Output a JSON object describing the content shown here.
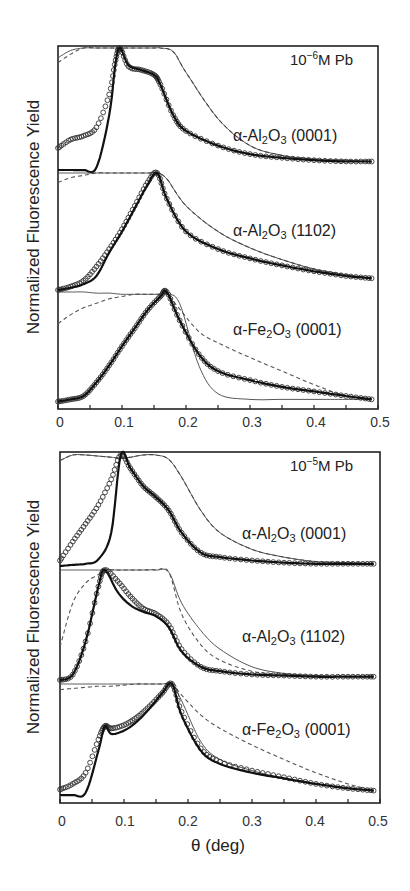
{
  "figure": {
    "ylabel": "Normalized Fluorescence Yield",
    "xlabel": "θ (deg)",
    "xticks": [
      "0",
      "0.1",
      "0.2",
      "0.3",
      "0.4",
      "0.5"
    ]
  },
  "panels": [
    {
      "title_base": "10",
      "title_exp": "−6",
      "title_rest": "M Pb",
      "curves": [
        {
          "label_pre": "α-Al",
          "sub1": "2",
          "mid": "O",
          "sub2": "3",
          "label_post": " (0001)"
        },
        {
          "label_pre": "α-Al",
          "sub1": "2",
          "mid": "O",
          "sub2": "3",
          "label_post": " (1102)"
        },
        {
          "label_pre": "α-Fe",
          "sub1": "2",
          "mid": "O",
          "sub2": "3",
          "label_post": " (0001)"
        }
      ]
    },
    {
      "title_base": "10",
      "title_exp": "−5",
      "title_rest": "M Pb",
      "curves": [
        {
          "label_pre": "α-Al",
          "sub1": "2",
          "mid": "O",
          "sub2": "3",
          "label_post": " (0001)"
        },
        {
          "label_pre": "α-Al",
          "sub1": "2",
          "mid": "O",
          "sub2": "3",
          "label_post": " (1102)"
        },
        {
          "label_pre": "α-Fe",
          "sub1": "2",
          "mid": "O",
          "sub2": "3",
          "label_post": " (0001)"
        }
      ]
    }
  ],
  "chart_data": [
    {
      "type": "scatter",
      "title": "10^-6 M Pb",
      "xlabel": "θ (deg)",
      "ylabel": "Normalized Fluorescence Yield",
      "xlim": [
        0,
        0.5
      ],
      "xticks": [
        0,
        0.1,
        0.2,
        0.3,
        0.4,
        0.5
      ],
      "yticks": [],
      "grid": false,
      "legend": "none; curves labeled inline, vertically offset",
      "series_styles": [
        "data: open circles",
        "fit: thick solid line",
        "model: thin solid line",
        "model: dashed line"
      ],
      "series": [
        {
          "name": "α-Al2O3 (0001)",
          "x": [
            0.0,
            0.02,
            0.04,
            0.06,
            0.08,
            0.09,
            0.097,
            0.11,
            0.13,
            0.15,
            0.16,
            0.18,
            0.2,
            0.25,
            0.3,
            0.35,
            0.4,
            0.45,
            0.49
          ],
          "data": [
            0.18,
            0.25,
            0.28,
            0.35,
            0.62,
            0.9,
            1.0,
            0.85,
            0.82,
            0.78,
            0.7,
            0.45,
            0.32,
            0.2,
            0.13,
            0.1,
            0.08,
            0.07,
            0.07
          ],
          "fit_thick": [
            0.0,
            0.0,
            0.0,
            0.02,
            0.45,
            0.88,
            1.0,
            0.86,
            0.82,
            0.78,
            0.7,
            0.45,
            0.32,
            0.2,
            0.13,
            0.1,
            0.08,
            0.07,
            0.07
          ],
          "thin_solid": [
            0.92,
            0.98,
            1.0,
            1.0,
            1.0,
            1.0,
            1.0,
            1.0,
            1.0,
            1.0,
            1.0,
            0.97,
            0.8,
            0.42,
            0.2,
            0.12,
            0.09,
            0.08,
            0.07
          ],
          "dashed": [
            0.88,
            0.95,
            1.0,
            1.0,
            1.0,
            1.0,
            1.0,
            1.0,
            1.0,
            1.0,
            1.0,
            0.97,
            0.8,
            0.42,
            0.2,
            0.12,
            0.09,
            0.08,
            0.07
          ]
        },
        {
          "name": "α-Al2O3 (1102)",
          "x": [
            0.0,
            0.02,
            0.04,
            0.06,
            0.08,
            0.1,
            0.12,
            0.14,
            0.155,
            0.17,
            0.2,
            0.25,
            0.3,
            0.35,
            0.4,
            0.45,
            0.49
          ],
          "data": [
            0.0,
            0.03,
            0.08,
            0.2,
            0.35,
            0.52,
            0.72,
            0.92,
            1.0,
            0.78,
            0.5,
            0.35,
            0.27,
            0.21,
            0.16,
            0.12,
            0.1
          ],
          "fit_thick": [
            0.0,
            0.02,
            0.05,
            0.12,
            0.32,
            0.5,
            0.7,
            0.9,
            1.0,
            0.78,
            0.5,
            0.35,
            0.27,
            0.21,
            0.16,
            0.12,
            0.1
          ],
          "thin_solid": [
            1.0,
            1.0,
            1.0,
            1.0,
            1.0,
            1.0,
            1.0,
            1.0,
            1.0,
            0.95,
            0.72,
            0.5,
            0.36,
            0.26,
            0.18,
            0.13,
            0.1
          ],
          "dashed": [
            0.92,
            0.96,
            0.98,
            1.0,
            1.0,
            1.0,
            1.0,
            1.0,
            1.0,
            0.95,
            0.72,
            0.5,
            0.36,
            0.26,
            0.18,
            0.13,
            0.1
          ]
        },
        {
          "name": "α-Fe2O3 (0001)",
          "x": [
            0.0,
            0.02,
            0.04,
            0.06,
            0.08,
            0.1,
            0.12,
            0.14,
            0.16,
            0.17,
            0.19,
            0.22,
            0.25,
            0.3,
            0.35,
            0.4,
            0.45,
            0.49
          ],
          "data": [
            0.03,
            0.05,
            0.08,
            0.2,
            0.35,
            0.52,
            0.68,
            0.84,
            0.96,
            1.0,
            0.75,
            0.45,
            0.3,
            0.22,
            0.16,
            0.12,
            0.08,
            0.05
          ],
          "fit_thick": [
            0.03,
            0.05,
            0.08,
            0.2,
            0.35,
            0.52,
            0.68,
            0.84,
            0.96,
            1.0,
            0.75,
            0.45,
            0.3,
            0.22,
            0.16,
            0.12,
            0.08,
            0.05
          ],
          "thin_solid": [
            1.0,
            1.0,
            1.0,
            0.99,
            0.99,
            0.98,
            0.98,
            0.98,
            0.98,
            0.98,
            0.9,
            0.35,
            0.1,
            0.05,
            0.05,
            0.05,
            0.05,
            0.05
          ],
          "dashed": [
            0.72,
            0.8,
            0.86,
            0.9,
            0.94,
            0.96,
            0.98,
            0.98,
            0.98,
            0.98,
            0.85,
            0.65,
            0.55,
            0.42,
            0.3,
            0.18,
            0.08,
            0.05
          ]
        }
      ]
    },
    {
      "type": "scatter",
      "title": "10^-5 M Pb",
      "xlabel": "θ (deg)",
      "ylabel": "Normalized Fluorescence Yield",
      "xlim": [
        0,
        0.5
      ],
      "xticks": [
        0,
        0.1,
        0.2,
        0.3,
        0.4,
        0.5
      ],
      "yticks": [],
      "grid": false,
      "legend": "none; curves labeled inline, vertically offset",
      "series_styles": [
        "data: open circles",
        "fit: thick solid line",
        "model: thin solid line",
        "model: dashed line"
      ],
      "series": [
        {
          "name": "α-Al2O3 (0001)",
          "x": [
            0.0,
            0.02,
            0.04,
            0.06,
            0.08,
            0.095,
            0.11,
            0.13,
            0.15,
            0.17,
            0.19,
            0.22,
            0.25,
            0.3,
            0.35,
            0.4,
            0.45,
            0.49
          ],
          "data": [
            0.05,
            0.22,
            0.38,
            0.55,
            0.78,
            1.0,
            0.88,
            0.72,
            0.62,
            0.5,
            0.3,
            0.12,
            0.08,
            0.05,
            0.03,
            0.02,
            0.02,
            0.02
          ],
          "fit_thick": [
            0.0,
            0.01,
            0.02,
            0.06,
            0.3,
            1.0,
            0.88,
            0.72,
            0.62,
            0.5,
            0.3,
            0.12,
            0.08,
            0.05,
            0.03,
            0.02,
            0.02,
            0.02
          ],
          "thin_solid": [
            0.95,
            1.0,
            1.0,
            0.99,
            0.98,
            0.97,
            0.98,
            1.0,
            1.0,
            0.96,
            0.8,
            0.5,
            0.3,
            0.15,
            0.08,
            0.04,
            0.03,
            0.02
          ],
          "dashed": [
            0.95,
            1.0,
            1.0,
            0.99,
            0.98,
            0.97,
            0.98,
            1.0,
            1.0,
            0.96,
            0.8,
            0.5,
            0.3,
            0.15,
            0.08,
            0.04,
            0.03,
            0.02
          ]
        },
        {
          "name": "α-Al2O3 (1102)",
          "x": [
            0.0,
            0.02,
            0.04,
            0.06,
            0.07,
            0.09,
            0.11,
            0.13,
            0.15,
            0.17,
            0.19,
            0.22,
            0.25,
            0.3,
            0.35,
            0.4,
            0.45,
            0.49
          ],
          "data": [
            0.0,
            0.05,
            0.35,
            0.85,
            1.0,
            0.9,
            0.76,
            0.65,
            0.6,
            0.5,
            0.28,
            0.12,
            0.08,
            0.05,
            0.04,
            0.03,
            0.03,
            0.03
          ],
          "fit_thick": [
            0.0,
            0.05,
            0.35,
            0.85,
            1.0,
            0.8,
            0.68,
            0.62,
            0.58,
            0.48,
            0.26,
            0.12,
            0.08,
            0.05,
            0.04,
            0.03,
            0.03,
            0.03
          ],
          "thin_solid": [
            1.0,
            1.0,
            1.0,
            1.0,
            1.0,
            1.0,
            1.0,
            1.0,
            1.0,
            0.98,
            0.7,
            0.45,
            0.28,
            0.12,
            0.06,
            0.04,
            0.03,
            0.03
          ],
          "dashed": [
            0.3,
            0.7,
            0.88,
            0.96,
            1.0,
            1.0,
            1.0,
            1.0,
            1.0,
            0.98,
            0.6,
            0.32,
            0.18,
            0.08,
            0.05,
            0.04,
            0.03,
            0.03
          ]
        },
        {
          "name": "α-Fe2O3 (0001)",
          "x": [
            0.0,
            0.02,
            0.04,
            0.06,
            0.07,
            0.08,
            0.1,
            0.12,
            0.14,
            0.16,
            0.175,
            0.19,
            0.22,
            0.25,
            0.3,
            0.35,
            0.4,
            0.45,
            0.49
          ],
          "data": [
            0.05,
            0.1,
            0.2,
            0.5,
            0.62,
            0.6,
            0.63,
            0.7,
            0.8,
            0.92,
            1.0,
            0.75,
            0.42,
            0.3,
            0.22,
            0.16,
            0.1,
            0.06,
            0.04
          ],
          "fit_thick": [
            0.0,
            0.0,
            0.02,
            0.4,
            0.62,
            0.55,
            0.58,
            0.66,
            0.78,
            0.92,
            1.0,
            0.72,
            0.4,
            0.28,
            0.2,
            0.15,
            0.1,
            0.06,
            0.04
          ],
          "thin_solid": [
            1.0,
            1.0,
            1.0,
            1.0,
            1.0,
            1.0,
            1.0,
            1.0,
            1.0,
            1.0,
            1.0,
            0.85,
            0.48,
            0.32,
            0.22,
            0.15,
            0.1,
            0.06,
            0.04
          ],
          "dashed": [
            0.95,
            0.96,
            0.97,
            0.98,
            0.98,
            0.98,
            0.99,
            1.0,
            1.0,
            1.0,
            1.0,
            0.9,
            0.72,
            0.6,
            0.45,
            0.32,
            0.2,
            0.1,
            0.04
          ]
        }
      ]
    }
  ]
}
